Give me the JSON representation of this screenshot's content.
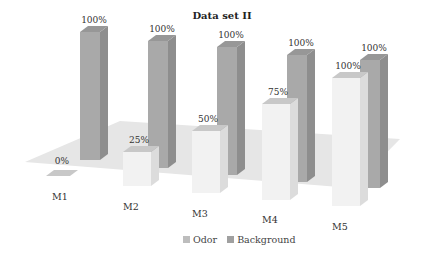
{
  "chart_data": {
    "type": "bar",
    "subtype": "3d-clustered-column",
    "title": "Data set II",
    "categories": [
      "M1",
      "M2",
      "M3",
      "M4",
      "M5"
    ],
    "series": [
      {
        "name": "Odor",
        "values": [
          0,
          25,
          50,
          75,
          100
        ],
        "labels": [
          "0%",
          "25%",
          "50%",
          "75%",
          "100%"
        ],
        "color": "#eeeeee"
      },
      {
        "name": "Background",
        "values": [
          100,
          100,
          100,
          100,
          100
        ],
        "labels": [
          "100%",
          "100%",
          "100%",
          "100%",
          "100%"
        ],
        "color": "#a8a8a8"
      }
    ],
    "xlabel": "",
    "ylabel": "",
    "ylim": [
      0,
      100
    ],
    "grid": false,
    "legend_position": "bottom"
  },
  "legend": {
    "items": [
      {
        "label": "Odor",
        "color": "#bdbdbd"
      },
      {
        "label": "Background",
        "color": "#a0a0a0"
      }
    ]
  },
  "colors": {
    "floor": "#e6e6e6",
    "odor_front": "#f2f2f2",
    "odor_side": "#dcdcdc",
    "odor_top": "#c8c8c8",
    "bg_front": "#a9a9a9",
    "bg_side": "#8e8e8e",
    "bg_top": "#979797"
  }
}
